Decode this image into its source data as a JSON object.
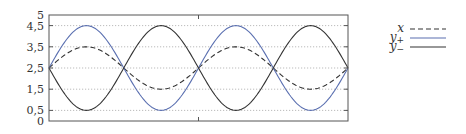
{
  "chart_data": {
    "type": "line",
    "title": "",
    "xlabel": "",
    "ylabel": "",
    "ylim": [
      0,
      5
    ],
    "xlim": [
      0,
      12.566
    ],
    "grid": {
      "y": true,
      "x": false,
      "style": "dotted"
    },
    "yticks": [
      {
        "value": 0,
        "label": "0"
      },
      {
        "value": 0.5,
        "label": "0,5"
      },
      {
        "value": 1.5,
        "label": "1,5"
      },
      {
        "value": 2.5,
        "label": "2,5"
      },
      {
        "value": 3.5,
        "label": "3,5"
      },
      {
        "value": 4.5,
        "label": "4,5"
      },
      {
        "value": 5,
        "label": "5"
      }
    ],
    "xticks_at": [
      6.283
    ],
    "legend_position": "right",
    "series": [
      {
        "name": "x",
        "label_main": "x",
        "label_sub": "",
        "style": "dashed",
        "color": "#333333",
        "formula": "2.5 + sin(t)",
        "offset": 2.5,
        "amplitude": 1,
        "x": [
          0,
          1.571,
          3.142,
          4.712,
          6.283,
          7.854,
          9.425,
          10.996,
          12.566
        ],
        "values": [
          2.5,
          3.5,
          2.5,
          1.5,
          2.5,
          3.5,
          2.5,
          1.5,
          2.5
        ]
      },
      {
        "name": "y+",
        "label_main": "y",
        "label_sub": "+",
        "style": "solid",
        "color": "#5a6fb0",
        "formula": "2.5 + 2 sin(t)",
        "offset": 2.5,
        "amplitude": 2,
        "x": [
          0,
          1.571,
          3.142,
          4.712,
          6.283,
          7.854,
          9.425,
          10.996,
          12.566
        ],
        "values": [
          2.5,
          4.5,
          2.5,
          0.5,
          2.5,
          4.5,
          2.5,
          0.5,
          2.5
        ]
      },
      {
        "name": "y−",
        "label_main": "y",
        "label_sub": "−",
        "style": "solid",
        "color": "#333333",
        "formula": "2.5 - 2 sin(t)",
        "offset": 2.5,
        "amplitude": -2,
        "x": [
          0,
          1.571,
          3.142,
          4.712,
          6.283,
          7.854,
          9.425,
          10.996,
          12.566
        ],
        "values": [
          2.5,
          0.5,
          2.5,
          4.5,
          2.5,
          0.5,
          2.5,
          4.5,
          2.5
        ]
      }
    ]
  },
  "colors": {
    "frame": "#555555",
    "grid": "#aaaaaa",
    "accent": "#5a6fb0"
  }
}
